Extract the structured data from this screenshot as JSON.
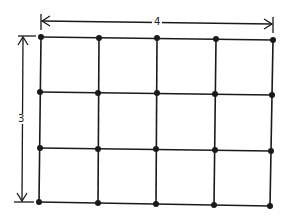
{
  "diagram": {
    "type": "grid",
    "columns": 4,
    "rows": 3,
    "dots_per_row": 5,
    "dots_per_column": 4,
    "width_label": "4",
    "height_label": "3",
    "line_color": "#1a1a1a"
  }
}
